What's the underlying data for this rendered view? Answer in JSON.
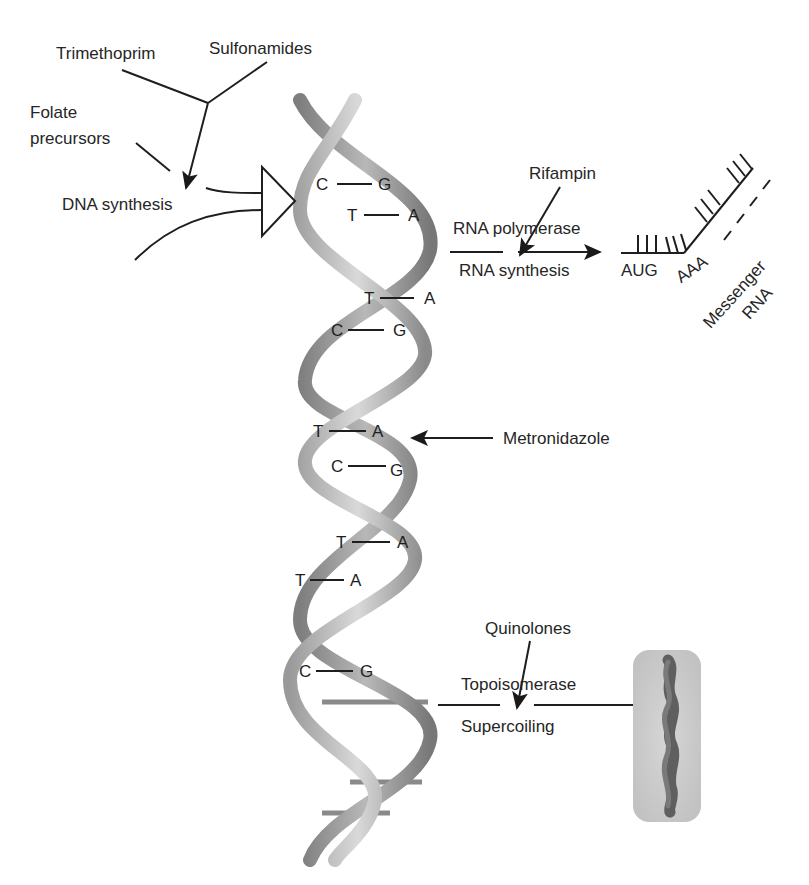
{
  "diagram": {
    "labels": {
      "trimethoprim": "Trimethoprim",
      "sulfonamides": "Sulfonamides",
      "folate_line1": "Folate",
      "folate_line2": "precursors",
      "dna_synthesis": "DNA synthesis",
      "rifampin": "Rifampin",
      "rna_polymerase": "RNA polymerase",
      "rna_synthesis": "RNA synthesis",
      "aug": "AUG",
      "aaa": "AAA",
      "messenger": "Messenger",
      "rna": "RNA",
      "metronidazole": "Metronidazole",
      "quinolones": "Quinolones",
      "topoisomerase": "Topoisomerase",
      "supercoiling": "Supercoiling"
    },
    "base_pairs": [
      {
        "left": "C",
        "right": "G"
      },
      {
        "left": "T",
        "right": "A"
      },
      {
        "left": "T",
        "right": "A"
      },
      {
        "left": "C",
        "right": "G"
      },
      {
        "left": "T",
        "right": "A"
      },
      {
        "left": "C",
        "right": "G"
      },
      {
        "left": "T",
        "right": "A"
      },
      {
        "left": "T",
        "right": "A"
      },
      {
        "left": "C",
        "right": "G"
      }
    ],
    "colors": {
      "strand_light": "#c8c8c8",
      "strand_dark": "#8e8e8e",
      "line": "#222222",
      "cell": "#cfcfcf",
      "chromosome": "#6d6d6d"
    }
  }
}
